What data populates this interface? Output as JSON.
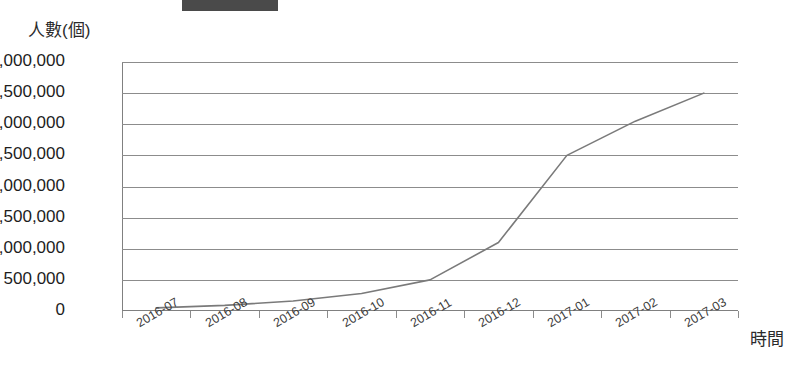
{
  "header": {
    "legend_swatch_color": "#4a4a4a",
    "title_partial": "",
    "title_visible": false
  },
  "axes": {
    "y_label": "人數(個)",
    "x_label": "時間",
    "y_ticks": [
      "0",
      "500,000",
      "1,000,000",
      "1,500,000",
      "2,000,000",
      "2,500,000",
      "3,000,000",
      "3,500,000",
      "4,000,000"
    ],
    "x_ticks": [
      "2016-07",
      "2016-08",
      "2016-09",
      "2016-10",
      "2016-11",
      "2016-12",
      "2017-01",
      "2017-02",
      "2017-03"
    ]
  },
  "style": {
    "line_color": "#7a7a7a",
    "grid_color": "#8c8c8c",
    "axis_color": "#808080",
    "background": "#ffffff"
  },
  "chart_data": {
    "type": "line",
    "title": "",
    "xlabel": "時間",
    "ylabel": "人數(個)",
    "categories": [
      "2016-07",
      "2016-08",
      "2016-09",
      "2016-10",
      "2016-11",
      "2016-12",
      "2017-01",
      "2017-02",
      "2017-03"
    ],
    "series": [
      {
        "name": "人數(個)",
        "values": [
          50000,
          90000,
          160000,
          280000,
          500000,
          1100000,
          2500000,
          3050000,
          3500000
        ]
      }
    ],
    "ylim": [
      0,
      4000000
    ],
    "ytick_step": 500000,
    "grid": "horizontal",
    "legend_position": "top"
  }
}
